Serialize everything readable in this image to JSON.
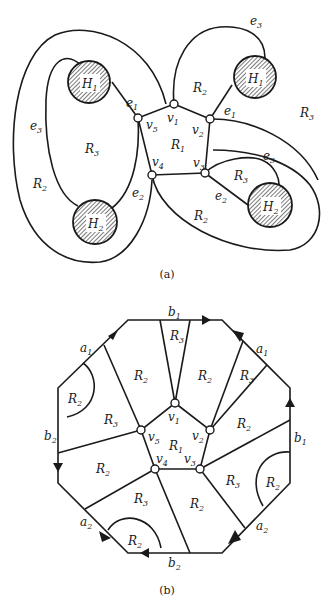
{
  "header_fragment": "... g ... g ...",
  "figure_a": {
    "caption": "(a)",
    "vertices": [
      {
        "id": "v1",
        "label": "v",
        "sub": "1"
      },
      {
        "id": "v2",
        "label": "v",
        "sub": "2"
      },
      {
        "id": "v3",
        "label": "v",
        "sub": "3"
      },
      {
        "id": "v4",
        "label": "v",
        "sub": "4"
      },
      {
        "id": "v5",
        "label": "v",
        "sub": "5"
      }
    ],
    "holes": [
      {
        "label": "H",
        "sub": "1"
      },
      {
        "label": "H",
        "sub": "1"
      },
      {
        "label": "H",
        "sub": "2"
      },
      {
        "label": "H",
        "sub": "2"
      }
    ],
    "edges": {
      "e1": {
        "label": "e",
        "sub": "1"
      },
      "e2": {
        "label": "e",
        "sub": "2"
      },
      "e3": {
        "label": "e",
        "sub": "3"
      }
    },
    "regions": {
      "R1": {
        "label": "R",
        "sub": "1"
      },
      "R2": {
        "label": "R",
        "sub": "2"
      },
      "R3": {
        "label": "R",
        "sub": "3"
      }
    }
  },
  "figure_b": {
    "caption": "(b)",
    "sides": {
      "a1": {
        "label": "a",
        "sub": "1"
      },
      "a2": {
        "label": "a",
        "sub": "2"
      },
      "b1": {
        "label": "b",
        "sub": "1"
      },
      "b2": {
        "label": "b",
        "sub": "2"
      }
    },
    "vertices": {
      "v1": {
        "label": "v",
        "sub": "1"
      },
      "v2": {
        "label": "v",
        "sub": "2"
      },
      "v3": {
        "label": "v",
        "sub": "3"
      },
      "v4": {
        "label": "v",
        "sub": "4"
      },
      "v5": {
        "label": "v",
        "sub": "5"
      }
    },
    "regions": {
      "R1": {
        "label": "R",
        "sub": "1"
      },
      "R2": {
        "label": "R",
        "sub": "2"
      },
      "R3": {
        "label": "R",
        "sub": "3"
      }
    }
  }
}
